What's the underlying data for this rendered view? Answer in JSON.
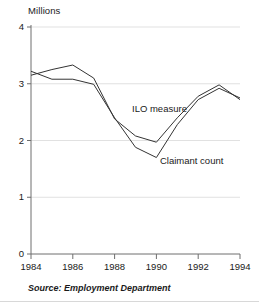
{
  "chart_data": {
    "type": "line",
    "title": "",
    "subtitle": "",
    "ylabel": "Millions",
    "xlabel": "",
    "x": [
      1984,
      1985,
      1986,
      1987,
      1988,
      1989,
      1990,
      1991,
      1992,
      1993,
      1994
    ],
    "xlim": [
      1984,
      1994
    ],
    "ylim": [
      0,
      4
    ],
    "xticks": [
      "1984",
      "1986",
      "1988",
      "1990",
      "1992",
      "1994"
    ],
    "xtick_values": [
      1984,
      1986,
      1988,
      1990,
      1992,
      1994
    ],
    "yticks": [
      "0",
      "1",
      "2",
      "3",
      "4"
    ],
    "ytick_values": [
      0,
      1,
      2,
      3,
      4
    ],
    "grid": "horizontal",
    "legend_position": "inline-annotation",
    "series": [
      {
        "name": "ILO measure",
        "values": [
          3.15,
          3.25,
          3.33,
          3.1,
          2.38,
          2.08,
          1.97,
          2.4,
          2.78,
          2.98,
          2.72
        ],
        "label_text": "ILO measure",
        "color": "#333333"
      },
      {
        "name": "Claimant count",
        "values": [
          3.22,
          3.08,
          3.08,
          2.99,
          2.4,
          1.88,
          1.7,
          2.28,
          2.72,
          2.92,
          2.75
        ],
        "label_text": "Claimant count",
        "color": "#333333"
      }
    ],
    "annotations": [
      {
        "text": "ILO measure",
        "x": 1988.6,
        "y": 2.55
      },
      {
        "text": "Claimant count",
        "x": 1990.3,
        "y": 1.55
      }
    ]
  },
  "footer": {
    "source": "Source: Employment Department"
  }
}
